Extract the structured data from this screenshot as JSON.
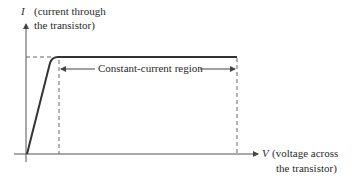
{
  "diagram": {
    "y_axis": {
      "symbol": "I",
      "label_line1": "(current through",
      "label_line2": "the transistor)"
    },
    "x_axis": {
      "symbol": "V",
      "label_line1": "(voltage across",
      "label_line2": "the transistor)"
    },
    "region_label": "Constant-current region",
    "colors": {
      "curve": "#333333",
      "axis": "#555555",
      "dashed": "#666666",
      "text": "#2a2a2a"
    }
  }
}
